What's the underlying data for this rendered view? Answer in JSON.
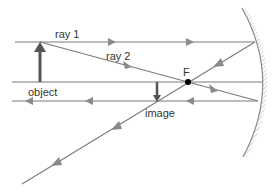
{
  "diagram": {
    "labels": {
      "ray1": "ray 1",
      "ray2": "ray 2",
      "focus": "F",
      "object": "object",
      "image": "image"
    },
    "elements": [
      {
        "id": "mirror",
        "type": "concave-mirror"
      },
      {
        "id": "principal-axis",
        "type": "line"
      },
      {
        "id": "object-arrow",
        "type": "arrow",
        "direction": "up"
      },
      {
        "id": "image-arrow",
        "type": "arrow",
        "direction": "down"
      },
      {
        "id": "focal-point",
        "type": "point",
        "label": "F"
      },
      {
        "id": "ray1-incident",
        "type": "ray",
        "description": "parallel to axis toward mirror"
      },
      {
        "id": "ray1-reflected",
        "type": "ray",
        "description": "reflects through F"
      },
      {
        "id": "ray2-incident",
        "type": "ray",
        "description": "through F toward mirror"
      },
      {
        "id": "ray2-reflected",
        "type": "ray",
        "description": "reflects parallel to axis"
      }
    ],
    "colors": {
      "ray": "#7a7a7a",
      "arrow": "#555555",
      "mirror": "#8a8a8a",
      "text": "#333333",
      "focus_point": "#000000"
    }
  }
}
